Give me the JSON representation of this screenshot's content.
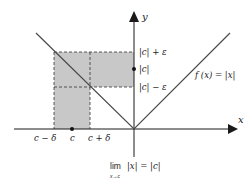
{
  "diagram": {
    "colors": {
      "axis": "#1a1a1a",
      "curve": "#4a4a4a",
      "shade": "#c8c8c8",
      "dashed": "#333333",
      "background": "#ffffff"
    },
    "axes": {
      "x_label": "x",
      "y_label": "y"
    },
    "function_label": "f (x) = |x|",
    "y_ticks": {
      "upper": "|c| + ε",
      "middle": "|c|",
      "lower": "|c| − ε"
    },
    "x_ticks": {
      "left": "c − δ",
      "center": "c",
      "right": "c + δ"
    },
    "limit_expression": {
      "lim": "lim",
      "subscript": "x→c",
      "body": "|x| = |c|"
    }
  }
}
